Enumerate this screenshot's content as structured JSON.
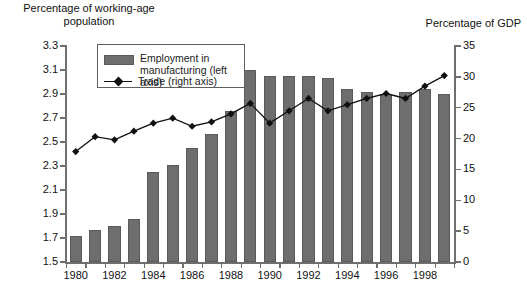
{
  "axis_captions": {
    "left": "Percentage of working-age\npopulation",
    "right": "Percentage of GDP"
  },
  "legend": {
    "bar_label": "Employment in\nmanufacturing (left axis)",
    "line_label": "Trade (right axis)",
    "bar_swatch_color": "#6e6e6e",
    "line_color": "#111111"
  },
  "chart_data": {
    "type": "bar",
    "title": "",
    "xlabel": "",
    "ylabel": "Percentage of working-age population",
    "y2label": "Percentage of GDP",
    "grid": false,
    "legend_position": "upper-left-inside",
    "categories": [
      "1980",
      "1981",
      "1982",
      "1983",
      "1984",
      "1985",
      "1986",
      "1987",
      "1988",
      "1989",
      "1990",
      "1991",
      "1992",
      "1993",
      "1994",
      "1995",
      "1996",
      "1997",
      "1998",
      "1999"
    ],
    "x_tick_labels": [
      "1980",
      "1982",
      "1984",
      "1986",
      "1988",
      "1990",
      "1992",
      "1994",
      "1996",
      "1998"
    ],
    "ylim": [
      1.5,
      3.3
    ],
    "y_ticks": [
      1.5,
      1.7,
      1.9,
      2.1,
      2.3,
      2.5,
      2.7,
      2.9,
      3.1,
      3.3
    ],
    "y2lim": [
      0,
      35
    ],
    "y2_ticks": [
      0,
      5,
      10,
      15,
      20,
      25,
      30,
      35
    ],
    "series": [
      {
        "name": "Employment in manufacturing (left axis)",
        "axis": "left",
        "type": "bar",
        "color": "#6e6e6e",
        "values": [
          1.72,
          1.77,
          1.8,
          1.86,
          2.25,
          2.31,
          2.45,
          2.57,
          2.76,
          3.1,
          3.05,
          3.05,
          3.05,
          3.03,
          2.94,
          2.92,
          2.9,
          2.92,
          2.94,
          2.9
        ]
      },
      {
        "name": "Trade (right axis)",
        "axis": "right",
        "type": "line",
        "color": "#111111",
        "marker": "diamond",
        "values": [
          17.9,
          20.3,
          19.8,
          21.2,
          22.5,
          23.3,
          22.0,
          22.7,
          24.0,
          25.7,
          22.5,
          24.5,
          26.5,
          24.5,
          25.5,
          26.5,
          27.3,
          26.5,
          28.5,
          30.2
        ]
      }
    ]
  }
}
